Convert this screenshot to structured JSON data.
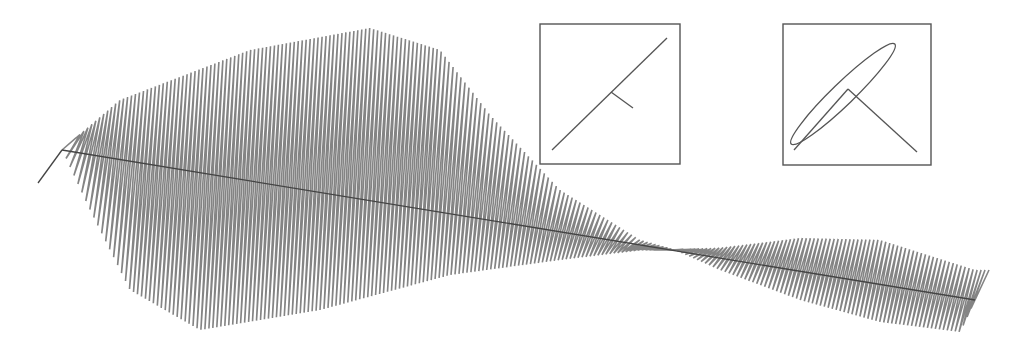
{
  "figure": {
    "title": "",
    "colors": {
      "trace": "#6e6e6e",
      "axis": "#444444",
      "frame": "#555555",
      "background": "#ffffff"
    },
    "axis": {
      "start": [
        62,
        150
      ],
      "end": [
        975,
        300
      ],
      "lead_in": [
        [
          38,
          183
        ],
        [
          62,
          150
        ]
      ]
    },
    "trace": {
      "cycles": 230,
      "tilt_dx": 14,
      "envelope_upper": [
        [
          62,
          150
        ],
        [
          120,
          100
        ],
        [
          250,
          50
        ],
        [
          370,
          28
        ],
        [
          440,
          50
        ],
        [
          490,
          115
        ],
        [
          560,
          190
        ],
        [
          640,
          240
        ],
        [
          675,
          250
        ],
        [
          720,
          248
        ],
        [
          800,
          238
        ],
        [
          880,
          240
        ],
        [
          975,
          270
        ]
      ],
      "envelope_lower": [
        [
          62,
          150
        ],
        [
          90,
          210
        ],
        [
          130,
          290
        ],
        [
          200,
          330
        ],
        [
          320,
          310
        ],
        [
          450,
          275
        ],
        [
          560,
          260
        ],
        [
          640,
          250
        ],
        [
          675,
          250
        ],
        [
          720,
          270
        ],
        [
          800,
          300
        ],
        [
          880,
          322
        ],
        [
          960,
          332
        ],
        [
          975,
          300
        ]
      ]
    },
    "insets": [
      {
        "name": "linear-polarization",
        "frame": {
          "x": 540,
          "y": 24,
          "w": 140,
          "h": 140
        },
        "line": [
          [
            552,
            150
          ],
          [
            667,
            38
          ]
        ],
        "tick": [
          [
            611,
            92
          ],
          [
            633,
            108
          ]
        ]
      },
      {
        "name": "elliptical-polarization",
        "frame": {
          "x": 783,
          "y": 24,
          "w": 148,
          "h": 141
        },
        "ellipse": {
          "cx": 843,
          "cy": 94,
          "rx": 72,
          "ry": 11,
          "rotate": -44
        },
        "line": [
          [
            790,
            156
          ],
          [
            917,
            152
          ]
        ],
        "vector": [
          [
            848,
            89
          ],
          [
            917,
            152
          ]
        ],
        "vector_tail": [
          [
            794,
            150
          ],
          [
            848,
            89
          ]
        ]
      }
    ]
  }
}
